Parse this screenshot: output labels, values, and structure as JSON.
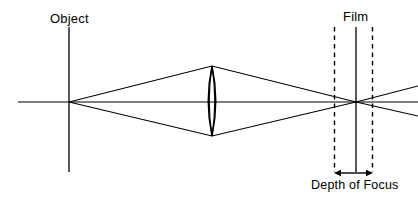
{
  "diagram": {
    "type": "optical-ray-diagram",
    "width": 418,
    "height": 204,
    "background_color": "#ffffff",
    "stroke_color": "#000000",
    "labels": {
      "object": "Object",
      "film": "Film",
      "depth_of_focus": "Depth of Focus"
    },
    "elements": {
      "object_plane": {
        "name": "object-plane-line",
        "style": "solid",
        "x": 69,
        "y_top": 27,
        "y_bottom": 172
      },
      "film_plane": {
        "name": "film-plane-line",
        "style": "solid",
        "x": 356,
        "y_top": 27,
        "y_bottom": 172
      },
      "near_focus_limit": {
        "name": "near-focus-dashed-line",
        "style": "dashed",
        "x": 334,
        "y_top": 27,
        "y_bottom": 172
      },
      "far_focus_limit": {
        "name": "far-focus-dashed-line",
        "style": "dashed",
        "x": 373,
        "y_top": 27,
        "y_bottom": 172
      },
      "optical_axis": {
        "name": "optical-axis-line",
        "style": "solid",
        "y": 102,
        "x_start": 18,
        "x_end": 418
      },
      "lens": {
        "name": "biconvex-lens",
        "center_x": 212,
        "top_y": 66,
        "bottom_y": 136,
        "half_thickness": 7
      },
      "object_point": {
        "x": 69,
        "y": 102
      },
      "focus_point": {
        "x": 356,
        "y": 102
      },
      "depth_of_focus_arrow": {
        "name": "depth-of-focus-arrow",
        "y": 173,
        "x_start": 335,
        "x_end": 372,
        "double_headed": true
      }
    },
    "rays": [
      {
        "name": "upper-ray",
        "points": "69,102 212,66 356,102 418,86"
      },
      {
        "name": "lower-ray",
        "points": "69,102 212,136 356,102 418,116"
      },
      {
        "name": "axis-ray",
        "points": "69,102 212,102 356,102 418,102"
      }
    ]
  }
}
